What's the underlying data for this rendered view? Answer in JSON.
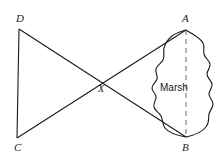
{
  "figure": {
    "background_color": "#ffffff",
    "stroke_color": "#1a1a1a",
    "width": 219,
    "height": 165
  },
  "points": {
    "D": {
      "label": "D",
      "x": 19,
      "y": 29
    },
    "A": {
      "label": "A",
      "x": 186,
      "y": 30
    },
    "C": {
      "label": "C",
      "x": 17,
      "y": 138
    },
    "B": {
      "label": "B",
      "x": 186,
      "y": 137
    },
    "X": {
      "label": "X",
      "x": 101,
      "y": 81
    }
  },
  "regions": {
    "marsh": {
      "label": "Marsh",
      "center_x": 177,
      "center_y": 88
    }
  },
  "segments": [
    {
      "name": "segment-DC",
      "from": "D",
      "to": "C",
      "style": "solid"
    },
    {
      "name": "segment-DB",
      "from": "D",
      "to": "B",
      "style": "solid"
    },
    {
      "name": "segment-CA",
      "from": "C",
      "to": "A",
      "style": "solid"
    },
    {
      "name": "segment-AB",
      "from": "A",
      "to": "B",
      "style": "dashed"
    }
  ],
  "icons": {
    "marsh_blob": "marsh-blob-icon"
  }
}
